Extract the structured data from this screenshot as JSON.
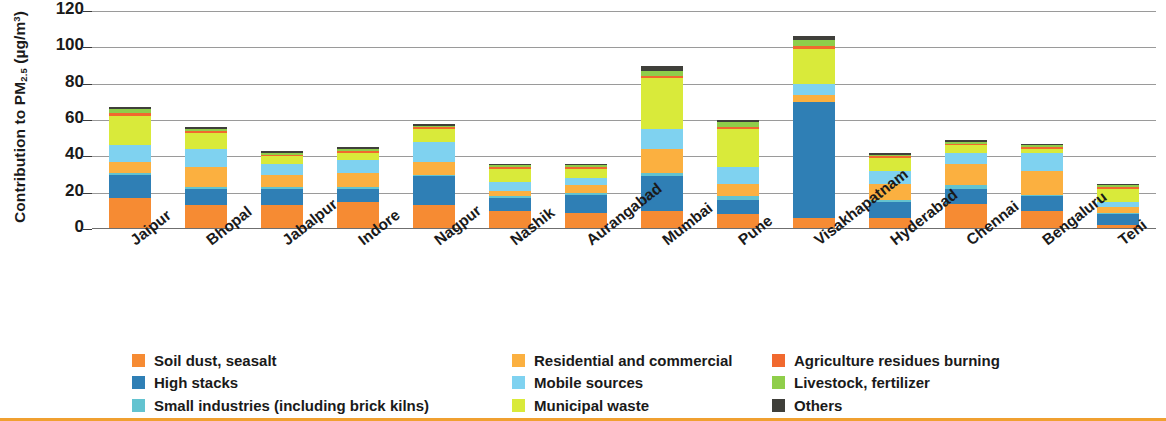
{
  "chart_data": {
    "type": "bar",
    "stacked": true,
    "title": "",
    "xlabel": "",
    "ylabel": "Contribution to PM2.5 (µg/m³)",
    "ylabel_parts": {
      "prefix": "Contribution to PM",
      "sub": "2.5",
      "unit_open": " (µg/m",
      "sup": "3",
      "unit_close": ")"
    },
    "ylim": [
      0,
      120
    ],
    "yticks": [
      0,
      20,
      40,
      60,
      80,
      100,
      120
    ],
    "ytick_labels": [
      "0",
      "20",
      "40",
      "60",
      "80",
      "100",
      "120"
    ],
    "grid": true,
    "legend_position": "bottom",
    "categories": [
      "Jaipur",
      "Bhopal",
      "Jabalpur",
      "Indore",
      "Nagpur",
      "Nashik",
      "Aurangabad",
      "Mumbai",
      "Pune",
      "Visakhapatnam",
      "Hyderabad",
      "Chennai",
      "Bengaluru",
      "Teni"
    ],
    "series": [
      {
        "name": "Soil dust, seasalt",
        "color": "#f68b33",
        "values": [
          17,
          13,
          13,
          15,
          13,
          10,
          9,
          10,
          8,
          6,
          6,
          14,
          10,
          2
        ]
      },
      {
        "name": "High stacks",
        "color": "#2f7fb5",
        "values": [
          13,
          9,
          9,
          7,
          16,
          7,
          10,
          19,
          8,
          64,
          9,
          8,
          8,
          6
        ]
      },
      {
        "name": "Small industries (including brick kilns)",
        "color": "#63c3d0",
        "values": [
          1,
          1,
          1,
          1,
          1,
          1,
          1,
          2,
          2,
          0,
          1,
          2,
          1,
          1
        ]
      },
      {
        "name": "Residential and commercial",
        "color": "#fbb040",
        "values": [
          6,
          11,
          7,
          8,
          7,
          3,
          4,
          13,
          7,
          4,
          9,
          12,
          13,
          3
        ]
      },
      {
        "name": "Mobile sources",
        "color": "#7fd2f0",
        "values": [
          9,
          10,
          6,
          7,
          11,
          5,
          4,
          11,
          9,
          6,
          7,
          6,
          10,
          3
        ]
      },
      {
        "name": "Municipal waste",
        "color": "#d9ea3a",
        "values": [
          16,
          9,
          4,
          4,
          7,
          7,
          5,
          28,
          21,
          19,
          7,
          4,
          2,
          7
        ]
      },
      {
        "name": "Agriculture residues burning",
        "color": "#f1692e",
        "values": [
          2,
          1,
          1,
          1,
          1,
          1,
          1,
          1,
          1,
          2,
          1,
          1,
          1,
          1
        ]
      },
      {
        "name": "Livestock, fertilizer",
        "color": "#8fce4a",
        "values": [
          2,
          1,
          1,
          1,
          1,
          1,
          1,
          3,
          3,
          3,
          1,
          1,
          1,
          1
        ]
      },
      {
        "name": "Others",
        "color": "#3f3f3a",
        "values": [
          1,
          1,
          1,
          1,
          1,
          1,
          1,
          3,
          1,
          2,
          1,
          1,
          1,
          1
        ]
      }
    ],
    "totals": [
      67,
      56,
      43,
      45,
      57,
      36,
      36,
      90,
      60,
      106,
      42,
      49,
      47,
      25
    ]
  },
  "legend": {
    "items": [
      {
        "label": "Soil dust, seasalt",
        "color": "#f68b33"
      },
      {
        "label": "High stacks",
        "color": "#2f7fb5"
      },
      {
        "label": "Small industries (including brick kilns)",
        "color": "#63c3d0"
      },
      {
        "label": "Residential and commercial",
        "color": "#fbb040"
      },
      {
        "label": "Mobile sources",
        "color": "#7fd2f0"
      },
      {
        "label": "Municipal waste",
        "color": "#d9ea3a"
      },
      {
        "label": "Agriculture residues burning",
        "color": "#f1692e"
      },
      {
        "label": "Livestock, fertilizer",
        "color": "#8fce4a"
      },
      {
        "label": "Others",
        "color": "#3f3f3a"
      }
    ]
  },
  "accent_color": "#f0a030"
}
